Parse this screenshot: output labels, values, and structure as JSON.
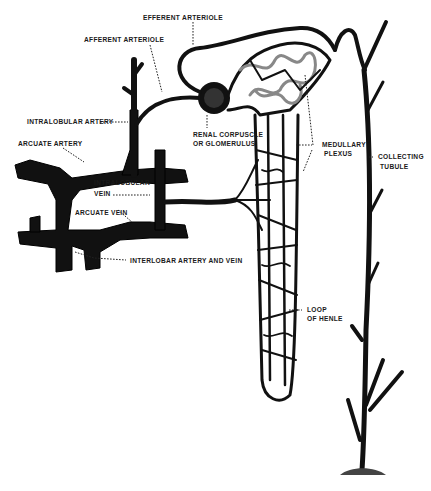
{
  "diagram": {
    "colors": {
      "ink": "#111111",
      "background": "#ffffff",
      "highlight": "#888888"
    },
    "labels": {
      "efferent_arteriole": "EFFERENT ARTERIOLE",
      "afferent_arteriole": "AFFERENT ARTERIOLE",
      "intralobular_artery": "INTRALOBULAR ARTERY",
      "arcuate_artery": "ARCUATE ARTERY",
      "renal_corpuscle_line1": "RENAL CORPUSCLE",
      "renal_corpuscle_line2": "OR GLOMERULUS",
      "medullary_plexus_line1": "MEDULLARY",
      "medullary_plexus_line2": "PLEXUS",
      "collecting_tubule_line1": "COLLECTING",
      "collecting_tubule_line2": "TUBULE",
      "intralobular_vein_line1": "INTRALOBULAR",
      "intralobular_vein_line2": "VEIN",
      "arcuate_vein": "ARCUATE VEIN",
      "interlobar": "INTERLOBAR ARTERY AND VEIN",
      "loop_of_henle_line1": "LOOP",
      "loop_of_henle_line2": "OF HENLE"
    }
  }
}
